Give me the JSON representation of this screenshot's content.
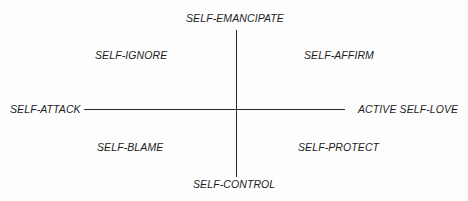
{
  "diagram": {
    "type": "quadrant",
    "axes": {
      "vertical": {
        "top": "SELF-EMANCIPATE",
        "bottom": "SELF-CONTROL"
      },
      "horizontal": {
        "left": "SELF-ATTACK",
        "right": "ACTIVE SELF-LOVE"
      }
    },
    "quadrants": {
      "top_left": "SELF-IGNORE",
      "top_right": "SELF-AFFIRM",
      "bottom_left": "SELF-BLAME",
      "bottom_right": "SELF-PROTECT"
    },
    "colors": {
      "line": "#2a2a2a",
      "text": "#1c1c1c",
      "background": "#ffffff"
    }
  }
}
